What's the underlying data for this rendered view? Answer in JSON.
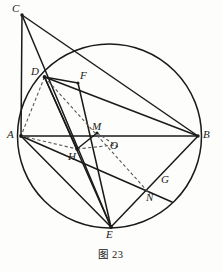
{
  "figure": {
    "caption": "图 23",
    "caption_number": "23",
    "type": "circle-geometry-diagram",
    "stroke_color": "#1a1a1a",
    "dash_color": "#555555",
    "background_color": "#fdfdfb",
    "width": 222,
    "height": 272
  },
  "circle": {
    "label": "O",
    "center_x": 109.5,
    "center_y": 136,
    "radius": 92
  },
  "points": [
    {
      "id": "C",
      "label": "C",
      "x": 22,
      "y": 15,
      "label_x": 13,
      "label_y": 5,
      "on_circle": false
    },
    {
      "id": "D",
      "label": "D",
      "x": 44.5,
      "y": 77,
      "label_x": 32,
      "label_y": 68,
      "on_circle": true
    },
    {
      "id": "F",
      "label": "F",
      "x": 78,
      "y": 83,
      "label_x": 81,
      "label_y": 72,
      "on_circle": false
    },
    {
      "id": "A",
      "label": "A",
      "x": 21,
      "y": 136,
      "label_x": 8,
      "label_y": 130,
      "on_circle": true
    },
    {
      "id": "B",
      "label": "B",
      "x": 198,
      "y": 136,
      "label_x": 203,
      "label_y": 130,
      "on_circle": true
    },
    {
      "id": "M",
      "label": "M",
      "x": 97,
      "y": 133,
      "label_x": 93,
      "label_y": 122,
      "on_circle": false
    },
    {
      "id": "O",
      "label": "O",
      "x": 109.5,
      "y": 141,
      "label_x": 110,
      "label_y": 141,
      "on_circle": false
    },
    {
      "id": "H",
      "label": "H",
      "x": 77,
      "y": 149,
      "label_x": 70,
      "label_y": 152,
      "on_circle": false
    },
    {
      "id": "G",
      "label": "G",
      "x": 158,
      "y": 181,
      "label_x": 161,
      "label_y": 175,
      "on_circle": true
    },
    {
      "id": "N",
      "label": "N",
      "x": 148,
      "y": 192,
      "label_x": 147,
      "label_y": 192,
      "on_circle": false
    },
    {
      "id": "E",
      "label": "E",
      "x": 111,
      "y": 227,
      "label_x": 107,
      "label_y": 229,
      "on_circle": true
    }
  ],
  "solid_segments": [
    {
      "name": "C-A",
      "from": "C",
      "to": "A"
    },
    {
      "name": "C-E",
      "from": "C",
      "to": "E"
    },
    {
      "name": "C-B",
      "from": "C",
      "to": "B"
    },
    {
      "name": "A-B",
      "from": "A",
      "to": "B"
    },
    {
      "name": "D-B",
      "from": "D",
      "to": "B"
    },
    {
      "name": "D-E",
      "from": "D",
      "to": "E"
    },
    {
      "name": "D-H",
      "from": "D",
      "to": "H"
    },
    {
      "name": "A-E",
      "from": "A",
      "to": "E"
    },
    {
      "name": "A-G",
      "from": "A",
      "to": "G"
    },
    {
      "name": "B-E",
      "from": "B",
      "to": "E"
    },
    {
      "name": "F-E",
      "from": "F",
      "to": "E"
    },
    {
      "name": "H-M",
      "from": "H",
      "to": "M"
    },
    {
      "name": "G-tail",
      "from": "G",
      "to": "G2"
    }
  ],
  "dashed_segments": [
    {
      "name": "D-A",
      "from": "D",
      "to": "A"
    },
    {
      "name": "D-N",
      "from": "D",
      "to": "N"
    },
    {
      "name": "A-H",
      "from": "A",
      "to": "H"
    },
    {
      "name": "H-O",
      "from": "H",
      "to": "O"
    },
    {
      "name": "M-O",
      "from": "M",
      "to": "O"
    }
  ]
}
